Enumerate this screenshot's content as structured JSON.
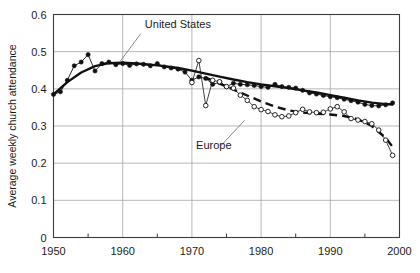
{
  "chart_data": {
    "type": "line",
    "title": "",
    "xlabel": "",
    "ylabel": "Average weekly church attendance",
    "xlim": [
      1950,
      2000
    ],
    "ylim": [
      0,
      0.6
    ],
    "grid": true,
    "legend_position": "inline-annotations",
    "xticks": [
      1950,
      1960,
      1970,
      1980,
      1990,
      2000
    ],
    "xtick_labels": [
      "1950",
      "1960",
      "1970",
      "1980",
      "1990",
      "2000"
    ],
    "xminor_ticks": [
      1955,
      1965,
      1975,
      1985,
      1995
    ],
    "yticks": [
      0,
      0.1,
      0.2,
      0.3,
      0.4,
      0.5,
      0.6
    ],
    "ytick_labels": [
      "0",
      "0.1",
      "0.2",
      "0.3",
      "0.4",
      "0.5",
      "0.6"
    ],
    "annotations": [
      {
        "text": "United States",
        "x": 1963.2,
        "y": 0.565,
        "leader_from": [
          1962.6,
          0.548
        ],
        "leader_to": [
          1959.6,
          0.473
        ]
      },
      {
        "text": "Europe",
        "x": 1970.6,
        "y": 0.238,
        "leader_from": [
          1974.2,
          0.247
        ],
        "leader_to": [
          1977.6,
          0.315
        ]
      }
    ],
    "series": [
      {
        "name": "United States",
        "marker": "filled-circle",
        "line_style": "thin-solid",
        "x": [
          1950,
          1951,
          1952,
          1953,
          1954,
          1955,
          1956,
          1957,
          1958,
          1959,
          1960,
          1961,
          1962,
          1963,
          1964,
          1965,
          1966,
          1967,
          1968,
          1969,
          1970,
          1971,
          1972,
          1973,
          1974,
          1975,
          1976,
          1977,
          1978,
          1979,
          1980,
          1981,
          1982,
          1983,
          1984,
          1985,
          1986,
          1987,
          1988,
          1989,
          1990,
          1991,
          1992,
          1993,
          1994,
          1995,
          1996,
          1997,
          1998,
          1999
        ],
        "y": [
          0.385,
          0.392,
          0.423,
          0.462,
          0.472,
          0.492,
          0.448,
          0.468,
          0.472,
          0.465,
          0.468,
          0.463,
          0.467,
          0.466,
          0.462,
          0.468,
          0.459,
          0.456,
          0.453,
          0.445,
          0.423,
          0.432,
          0.428,
          0.412,
          0.418,
          0.406,
          0.415,
          0.412,
          0.411,
          0.409,
          0.406,
          0.404,
          0.412,
          0.406,
          0.404,
          0.402,
          0.396,
          0.389,
          0.386,
          0.382,
          0.379,
          0.376,
          0.372,
          0.368,
          0.364,
          0.358,
          0.355,
          0.354,
          0.357,
          0.362
        ]
      },
      {
        "name": "United States trend",
        "marker": "none",
        "line_style": "thick-solid",
        "x": [
          1950,
          1952,
          1954,
          1956,
          1958,
          1960,
          1962,
          1964,
          1966,
          1968,
          1970,
          1972,
          1974,
          1976,
          1978,
          1980,
          1982,
          1984,
          1986,
          1988,
          1990,
          1992,
          1994,
          1996,
          1998,
          1999
        ],
        "y": [
          0.385,
          0.418,
          0.444,
          0.461,
          0.469,
          0.47,
          0.468,
          0.465,
          0.461,
          0.456,
          0.449,
          0.441,
          0.433,
          0.425,
          0.418,
          0.412,
          0.407,
          0.402,
          0.396,
          0.39,
          0.383,
          0.376,
          0.369,
          0.363,
          0.359,
          0.358
        ]
      },
      {
        "name": "Europe",
        "marker": "open-circle",
        "line_style": "thin-solid",
        "x": [
          1970,
          1971,
          1972,
          1973,
          1974,
          1975,
          1976,
          1977,
          1978,
          1979,
          1980,
          1981,
          1982,
          1983,
          1984,
          1985,
          1986,
          1987,
          1988,
          1989,
          1990,
          1991,
          1992,
          1993,
          1994,
          1995,
          1996,
          1997,
          1998,
          1999
        ],
        "y": [
          0.417,
          0.476,
          0.355,
          0.423,
          0.419,
          0.406,
          0.402,
          0.383,
          0.369,
          0.352,
          0.344,
          0.339,
          0.33,
          0.325,
          0.327,
          0.336,
          0.345,
          0.338,
          0.336,
          0.337,
          0.346,
          0.352,
          0.338,
          0.32,
          0.316,
          0.312,
          0.306,
          0.289,
          0.262,
          0.221
        ]
      },
      {
        "name": "Europe trend",
        "marker": "none",
        "line_style": "thick-dashed",
        "x": [
          1972,
          1974,
          1976,
          1978,
          1980,
          1982,
          1984,
          1986,
          1988,
          1990,
          1992,
          1994,
          1996,
          1998,
          1999
        ],
        "y": [
          0.43,
          0.414,
          0.398,
          0.382,
          0.366,
          0.352,
          0.342,
          0.336,
          0.333,
          0.331,
          0.327,
          0.318,
          0.3,
          0.268,
          0.244
        ]
      }
    ]
  }
}
